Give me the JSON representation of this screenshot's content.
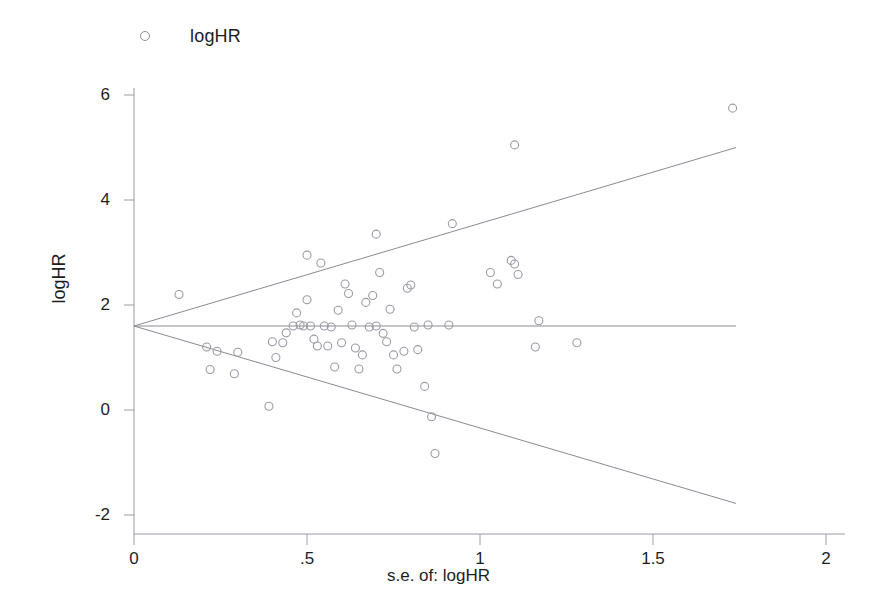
{
  "figure": {
    "background": "#ffffff",
    "marker_color": "#9a9aa6",
    "line_color": "#8a8a94",
    "axis_color": "#9a9aa6",
    "text_color": "#1d1d1d"
  },
  "legend": {
    "position": "top-left",
    "marker": "open-circle",
    "label": "logHR"
  },
  "axes": {
    "x_title": "s.e. of: logHR",
    "y_title": "logHR",
    "x_ticks": [
      "0",
      ".5",
      "1",
      "1.5",
      "2"
    ],
    "y_ticks": [
      "6",
      "4",
      "2",
      "0",
      "-2"
    ]
  },
  "chart_data": {
    "type": "scatter",
    "title": "",
    "subtitle": "",
    "xlabel": "s.e. of: logHR",
    "ylabel": "logHR",
    "xlim": [
      0,
      2
    ],
    "ylim": [
      -2,
      6
    ],
    "xticks": [
      0,
      0.5,
      1,
      1.5,
      2
    ],
    "xticklabels": [
      "0",
      ".5",
      "1",
      "1.5",
      "2"
    ],
    "yticks": [
      6,
      4,
      2,
      0,
      -2
    ],
    "yticklabels": [
      "6",
      "4",
      "2",
      "0",
      "-2"
    ],
    "grid": false,
    "legend": [
      "logHR"
    ],
    "legend_position": "top-left",
    "annotations": [
      "Funnel plot of logHR against its standard error",
      "Pooled effect reference line at logHR = 1.60",
      "Pseudo 95% confidence limits form the funnel"
    ],
    "series": [
      {
        "name": "logHR",
        "marker": "open-circle",
        "marker_color": "#9a9aa6",
        "x": [
          0.13,
          0.21,
          0.22,
          0.24,
          0.29,
          0.3,
          0.39,
          0.4,
          0.41,
          0.43,
          0.44,
          0.46,
          0.47,
          0.48,
          0.49,
          0.5,
          0.5,
          0.51,
          0.52,
          0.53,
          0.54,
          0.55,
          0.56,
          0.57,
          0.58,
          0.59,
          0.6,
          0.61,
          0.62,
          0.63,
          0.64,
          0.65,
          0.66,
          0.67,
          0.68,
          0.69,
          0.7,
          0.7,
          0.71,
          0.72,
          0.73,
          0.74,
          0.75,
          0.76,
          0.78,
          0.79,
          0.8,
          0.81,
          0.82,
          0.84,
          0.85,
          0.86,
          0.87,
          0.91,
          0.92,
          1.03,
          1.05,
          1.09,
          1.1,
          1.1,
          1.11,
          1.16,
          1.17,
          1.28,
          1.73
        ],
        "y": [
          2.2,
          1.2,
          0.77,
          1.12,
          0.69,
          1.1,
          0.07,
          1.3,
          1.0,
          1.28,
          1.47,
          1.6,
          1.85,
          1.62,
          1.6,
          2.1,
          2.95,
          1.6,
          1.35,
          1.22,
          2.8,
          1.6,
          1.22,
          1.58,
          0.82,
          1.9,
          1.28,
          2.4,
          2.22,
          1.62,
          1.18,
          0.78,
          1.05,
          2.05,
          1.58,
          2.18,
          1.6,
          3.35,
          2.62,
          1.46,
          1.3,
          1.92,
          1.05,
          0.78,
          1.12,
          2.32,
          2.38,
          1.58,
          1.15,
          0.45,
          1.62,
          -0.13,
          -0.83,
          1.62,
          3.55,
          2.62,
          2.4,
          2.85,
          2.78,
          5.05,
          2.58,
          1.2,
          1.7,
          1.28,
          5.75
        ]
      }
    ],
    "reference_line": {
      "type": "horizontal",
      "value": 1.6,
      "x_from": 0.0,
      "x_to": 1.74
    },
    "funnel_limits": [
      {
        "name": "upper-95-limit",
        "from": [
          0.0,
          1.6
        ],
        "to": [
          1.74,
          5.0
        ]
      },
      {
        "name": "lower-95-limit",
        "from": [
          0.0,
          1.6
        ],
        "to": [
          1.74,
          -1.78
        ]
      }
    ]
  }
}
